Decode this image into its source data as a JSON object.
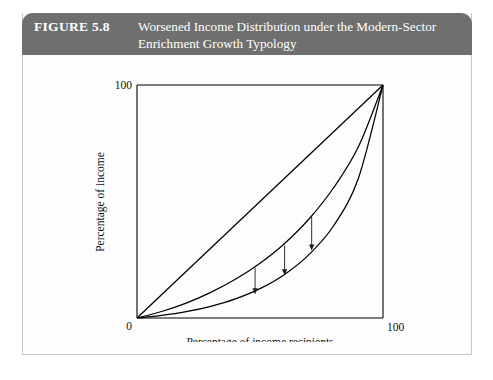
{
  "figure": {
    "number_label": "FIGURE 5.8",
    "title_line1": "Worsened Income Distribution under the Modern-Sector",
    "title_line2": "Enrichment Growth Typology",
    "header_color": "#6f6f6f",
    "header_text_color": "#ffffff",
    "border_color": "#c9c9c9",
    "page_background": "#ffffff"
  },
  "chart_data": {
    "type": "line",
    "title": "Worsened Income Distribution under the Modern-Sector Enrichment Growth Typology",
    "xlabel": "Percentage of income recipients",
    "ylabel": "Percentage of income",
    "xlim": [
      0,
      100
    ],
    "ylim": [
      0,
      100
    ],
    "grid": false,
    "legend": "none",
    "x_ticks": [
      "0",
      "100"
    ],
    "y_ticks": [
      "0",
      "100"
    ],
    "x_tick_values": [
      0,
      100
    ],
    "y_tick_values": [
      0,
      100
    ],
    "line_color": "#000000",
    "series": [
      {
        "name": "Line of equality",
        "kind": "diagonal",
        "x": [
          0,
          10,
          20,
          30,
          40,
          50,
          60,
          70,
          80,
          90,
          100
        ],
        "values": [
          0,
          10,
          20,
          30,
          40,
          50,
          60,
          70,
          80,
          90,
          100
        ]
      },
      {
        "name": "Lorenz curve before growth",
        "kind": "lorenz-before",
        "x": [
          0,
          10,
          20,
          30,
          40,
          50,
          60,
          70,
          80,
          90,
          100
        ],
        "values": [
          0,
          2.8,
          6.4,
          11.0,
          16.6,
          23.5,
          32.0,
          42.6,
          56.0,
          73.5,
          100
        ]
      },
      {
        "name": "Lorenz curve after growth",
        "kind": "lorenz-after",
        "x": [
          0,
          10,
          20,
          30,
          40,
          50,
          60,
          70,
          80,
          90,
          100
        ],
        "values": [
          0,
          1.1,
          2.7,
          5.0,
          8.2,
          12.6,
          18.7,
          27.3,
          39.7,
          60.0,
          100
        ]
      }
    ],
    "annotations": [
      {
        "name": "shift-arrow-1",
        "label": "",
        "x": 48,
        "y_from": 22.4,
        "y_to": 10.2,
        "direction": "down"
      },
      {
        "name": "shift-arrow-2",
        "label": "",
        "x": 60,
        "y_from": 32.0,
        "y_to": 18.3,
        "direction": "down"
      },
      {
        "name": "shift-arrow-3",
        "label": "",
        "x": 71,
        "y_from": 44.3,
        "y_to": 29.0,
        "direction": "down"
      }
    ]
  }
}
